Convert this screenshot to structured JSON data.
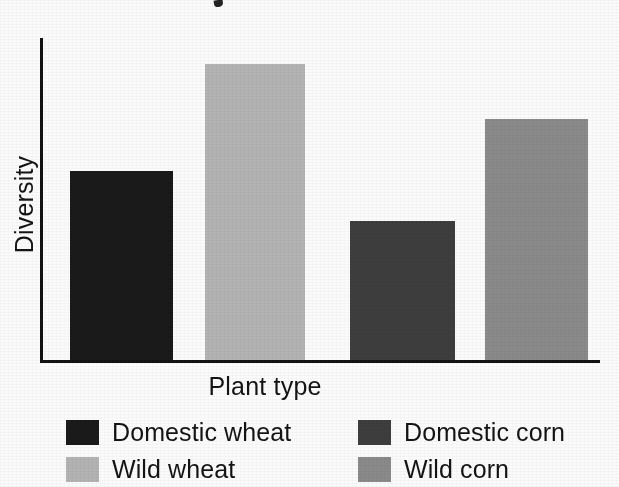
{
  "chart_data": {
    "type": "bar",
    "title": "",
    "xlabel": "Plant type",
    "ylabel": "Diversity",
    "grid": false,
    "legend_position": "bottom",
    "axis_color": "#121212",
    "background": "#fbfbfb",
    "ylim": [
      0,
      330
    ],
    "categories": [
      "Domestic wheat",
      "Wild wheat",
      "Domestic corn",
      "Wild corn"
    ],
    "values": [
      190,
      297,
      140,
      242
    ],
    "bars": [
      {
        "name": "Domestic wheat",
        "value": 190,
        "color": "#1a1a1a",
        "x": 70,
        "width": 103
      },
      {
        "name": "Wild wheat",
        "value": 297,
        "color": "#b3b3b3",
        "x": 205,
        "width": 100
      },
      {
        "name": "Domestic corn",
        "value": 140,
        "color": "#3d3d3d",
        "x": 350,
        "width": 105
      },
      {
        "name": "Wild corn",
        "value": 242,
        "color": "#8a8a8a",
        "x": 485,
        "width": 103
      }
    ],
    "legend": [
      {
        "label": "Domestic wheat",
        "color": "#1a1a1a"
      },
      {
        "label": "Domestic corn",
        "color": "#3d3d3d"
      },
      {
        "label": "Wild wheat",
        "color": "#b3b3b3"
      },
      {
        "label": "Wild corn",
        "color": "#8a8a8a"
      }
    ]
  }
}
